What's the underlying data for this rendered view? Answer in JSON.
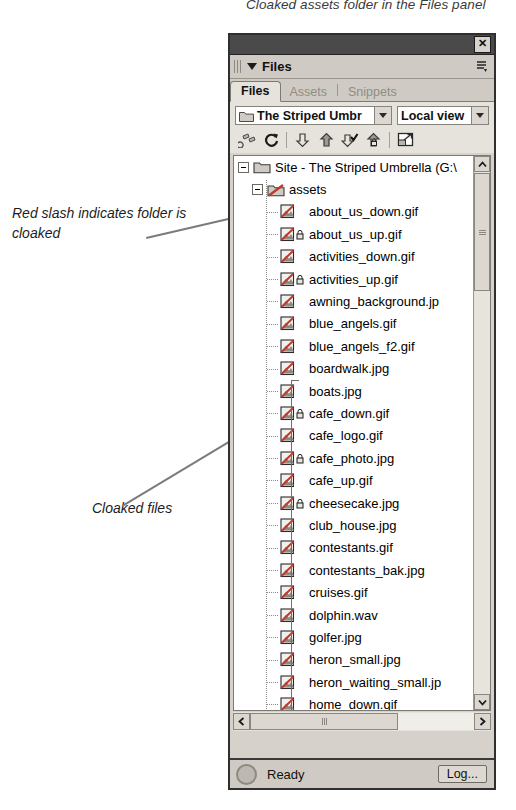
{
  "captions": {
    "top": "Cloaked assets folder in the Files panel",
    "annotation_1": "Red slash indicates folder is cloaked",
    "annotation_2": "Cloaked files"
  },
  "panel": {
    "title": "Files",
    "close_label": "✕",
    "options_menu_name": "panel-options-menu",
    "tabs": [
      {
        "label": "Files",
        "active": true
      },
      {
        "label": "Assets",
        "active": false
      },
      {
        "label": "Snippets",
        "active": false
      }
    ],
    "site_select": {
      "value": "The Striped Umbr",
      "name": "site-select"
    },
    "view_select": {
      "value": "Local view",
      "name": "view-select"
    },
    "toolbar": [
      {
        "name": "connect-to-remote-host-button",
        "title": "Connect to remote host"
      },
      {
        "name": "refresh-button",
        "title": "Refresh"
      },
      {
        "name": "get-files-button",
        "title": "Get files"
      },
      {
        "name": "put-files-button",
        "title": "Put files"
      },
      {
        "name": "check-out-button",
        "title": "Check out"
      },
      {
        "name": "check-in-button",
        "title": "Check in"
      },
      {
        "name": "expand-collapse-button",
        "title": "Expand/Collapse"
      }
    ]
  },
  "tree": {
    "root": {
      "label": "Site - The Striped Umbrella (G:\\",
      "expanded": true,
      "cloaked": false
    },
    "folder": {
      "label": "assets",
      "expanded": true,
      "cloaked": true
    },
    "files": [
      {
        "name": "about_us_down.gif",
        "cloaked": true,
        "locked": false
      },
      {
        "name": "about_us_up.gif",
        "cloaked": true,
        "locked": true
      },
      {
        "name": "activities_down.gif",
        "cloaked": true,
        "locked": false
      },
      {
        "name": "activities_up.gif",
        "cloaked": true,
        "locked": true
      },
      {
        "name": "awning_background.jp",
        "cloaked": true,
        "locked": false
      },
      {
        "name": "blue_angels.gif",
        "cloaked": true,
        "locked": false
      },
      {
        "name": "blue_angels_f2.gif",
        "cloaked": true,
        "locked": false
      },
      {
        "name": "boardwalk.jpg",
        "cloaked": true,
        "locked": false
      },
      {
        "name": "boats.jpg",
        "cloaked": true,
        "locked": false
      },
      {
        "name": "cafe_down.gif",
        "cloaked": true,
        "locked": true
      },
      {
        "name": "cafe_logo.gif",
        "cloaked": true,
        "locked": false
      },
      {
        "name": "cafe_photo.jpg",
        "cloaked": true,
        "locked": true
      },
      {
        "name": "cafe_up.gif",
        "cloaked": true,
        "locked": false
      },
      {
        "name": "cheesecake.jpg",
        "cloaked": true,
        "locked": true
      },
      {
        "name": "club_house.jpg",
        "cloaked": true,
        "locked": false
      },
      {
        "name": "contestants.gif",
        "cloaked": true,
        "locked": false
      },
      {
        "name": "contestants_bak.jpg",
        "cloaked": true,
        "locked": false
      },
      {
        "name": "cruises.gif",
        "cloaked": true,
        "locked": false
      },
      {
        "name": "dolphin.wav",
        "cloaked": true,
        "locked": false
      },
      {
        "name": "golfer.jpg",
        "cloaked": true,
        "locked": false
      },
      {
        "name": "heron_small.jpg",
        "cloaked": true,
        "locked": false
      },
      {
        "name": "heron_waiting_small.jp",
        "cloaked": true,
        "locked": false
      },
      {
        "name": "home_down.gif",
        "cloaked": true,
        "locked": false
      },
      {
        "name": "home_up.gif",
        "cloaked": true,
        "locked": true
      }
    ]
  },
  "statusbar": {
    "text": "Ready",
    "log_label": "Log..."
  },
  "colors": {
    "cloak_slash": "#c0392b",
    "panel_bg": "#d6d2cb",
    "toolbar_bg": "#e6e3dd",
    "titlebar": "#4a4a4a",
    "list_bg": "#ffffff"
  }
}
